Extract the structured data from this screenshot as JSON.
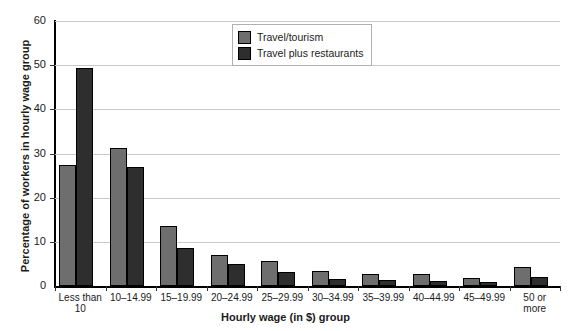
{
  "chart_data": {
    "type": "bar",
    "title": "",
    "xlabel": "Hourly wage (in $) group",
    "ylabel": "Percentage of workers in hourly wage group",
    "ylim": [
      0,
      60
    ],
    "yticks": [
      0,
      10,
      20,
      30,
      40,
      50,
      60
    ],
    "grid": true,
    "legend_position": "top-center",
    "categories": [
      "Less than 10",
      "10–14.99",
      "15–19.99",
      "20–24.99",
      "25–29.99",
      "30–34.99",
      "35–39.99",
      "40–44.99",
      "45–49.99",
      "50 or more"
    ],
    "category_labels_multiline": [
      [
        "Less than",
        "10"
      ],
      [
        "10–14.99"
      ],
      [
        "15–19.99"
      ],
      [
        "20–24.99"
      ],
      [
        "25–29.99"
      ],
      [
        "30–34.99"
      ],
      [
        "35–39.99"
      ],
      [
        "40–44.99"
      ],
      [
        "45–49.99"
      ],
      [
        "50 or",
        "more"
      ]
    ],
    "series": [
      {
        "name": "Travel/tourism",
        "color": "#6e6e6e",
        "values": [
          27.5,
          31.3,
          13.6,
          7.1,
          5.7,
          3.3,
          2.8,
          2.7,
          1.8,
          4.3
        ]
      },
      {
        "name": "Travel plus restaurants",
        "color": "#2e2e2e",
        "values": [
          49.3,
          26.9,
          8.7,
          5.0,
          3.1,
          1.6,
          1.4,
          1.1,
          0.9,
          2.0
        ]
      }
    ]
  },
  "legend": {
    "items": [
      {
        "label": "Travel/tourism",
        "swatch": "light"
      },
      {
        "label": "Travel plus restaurants",
        "swatch": "dark"
      }
    ]
  },
  "axes": {
    "y_title": "Percentage of workers in hourly wage group",
    "x_title": "Hourly wage (in $) group"
  }
}
